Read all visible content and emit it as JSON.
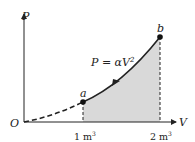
{
  "diagram": {
    "type": "pv-diagram",
    "axes": {
      "x_label": "V",
      "y_label": "P",
      "origin_label": "O"
    },
    "curve": {
      "equation": "P = αV²",
      "equation_main": "P = αV",
      "equation_exp": "2"
    },
    "points": [
      {
        "label": "a",
        "V": "1 m",
        "V_exp": "3"
      },
      {
        "label": "b",
        "V": "2 m",
        "V_exp": "3"
      }
    ],
    "shaded_region": "work done from a to b",
    "colors": {
      "shade": "#d9d9d9",
      "line": "#222222"
    }
  }
}
